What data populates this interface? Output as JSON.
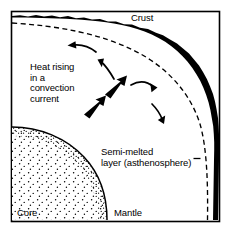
{
  "diagram": {
    "type": "cross-section",
    "frame": {
      "stroke_color": "#000000"
    },
    "labels": {
      "crust": "Crust",
      "heat_rising": "Heat rising\nin a\nconvection\ncurrent",
      "semi_melted": "Semi-melted\nlayer (asthenosphere)",
      "core": "Core",
      "mantle": "Mantle"
    },
    "layers": [
      {
        "name": "crust",
        "label": "Crust",
        "render": "thick irregular black arc band",
        "color": "#000000"
      },
      {
        "name": "asthenosphere",
        "label": "Semi-melted layer (asthenosphere)",
        "render": "dashed arc inside crust",
        "color": "#000000"
      },
      {
        "name": "mantle",
        "label": "Mantle",
        "render": "white region between core and crust",
        "color": "#ffffff"
      },
      {
        "name": "core",
        "label": "Core",
        "render": "stippled quarter circle at lower-left",
        "color": "#000000"
      }
    ],
    "arrows": [
      {
        "name": "rising-block-arrow-lower",
        "style": "thick-block",
        "direction": "up-right"
      },
      {
        "name": "rising-block-arrow-upper",
        "style": "thick-block",
        "direction": "up-right"
      },
      {
        "name": "convection-curve-top-left",
        "style": "thin-curved",
        "direction": "left"
      },
      {
        "name": "convection-curve-mid-left",
        "style": "thin-curved",
        "direction": "up"
      },
      {
        "name": "convection-curve-top-right",
        "style": "thin-curved",
        "direction": "right-down"
      },
      {
        "name": "convection-curve-lower-right",
        "style": "thin-curved",
        "direction": "down"
      }
    ]
  }
}
